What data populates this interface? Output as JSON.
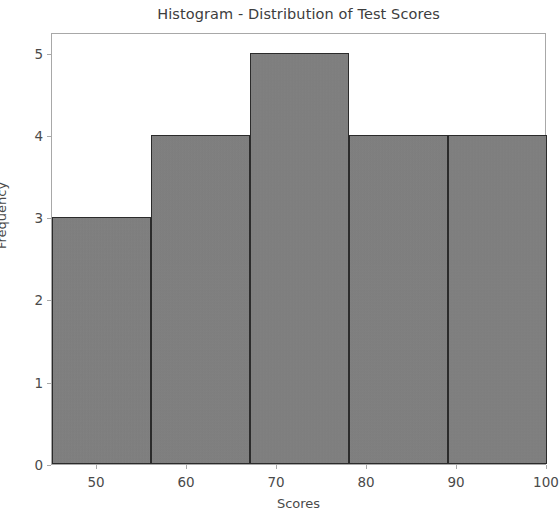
{
  "figure": {
    "background_color": "#ffffff",
    "width": 560,
    "height": 517
  },
  "chart_data": {
    "type": "bar",
    "title": "Histogram - Distribution of Test Scores",
    "xlabel": "Scores",
    "ylabel": "Frequency",
    "xlim": [
      45,
      100
    ],
    "ylim": [
      0,
      5.25
    ],
    "grid": false,
    "legend": null,
    "bar_color": "#808080",
    "bar_edge_color": "#2b2b2b",
    "axes_color": "#a8a8a8",
    "text_color": "#4a4a4a",
    "xticks": [
      50,
      60,
      70,
      80,
      90,
      100
    ],
    "xtick_labels": [
      "50",
      "60",
      "70",
      "80",
      "90",
      "100"
    ],
    "yticks": [
      0,
      1,
      2,
      3,
      4,
      5
    ],
    "ytick_labels": [
      "0",
      "1",
      "2",
      "3",
      "4",
      "5"
    ],
    "bin_edges": [
      45,
      56,
      67,
      78,
      89,
      100
    ],
    "bins": [
      {
        "range": "45-56",
        "left": 45,
        "right": 56,
        "frequency": 3
      },
      {
        "range": "56-67",
        "left": 56,
        "right": 67,
        "frequency": 4
      },
      {
        "range": "67-78",
        "left": 67,
        "right": 78,
        "frequency": 5
      },
      {
        "range": "78-89",
        "left": 78,
        "right": 89,
        "frequency": 4
      },
      {
        "range": "89-100",
        "left": 89,
        "right": 100,
        "frequency": 4
      }
    ],
    "values": [
      3,
      4,
      5,
      4,
      4
    ],
    "categories": [
      "45-56",
      "56-67",
      "67-78",
      "78-89",
      "89-100"
    ]
  }
}
